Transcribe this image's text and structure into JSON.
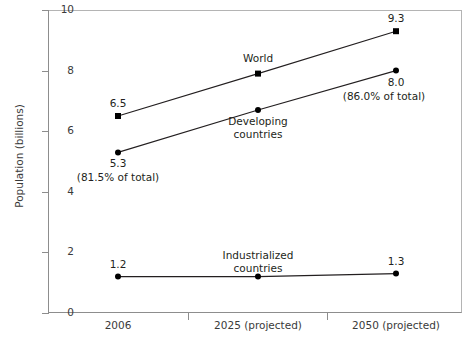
{
  "chart_data": {
    "type": "line",
    "title": "",
    "xlabel": "",
    "ylabel": "Population (billions)",
    "categories": [
      "2006",
      "2025 (projected)",
      "2050 (projected)"
    ],
    "ylim": [
      0,
      10
    ],
    "ytick_labels": [
      "0",
      "2",
      "4",
      "6",
      "8",
      "10"
    ],
    "ytick_values": [
      0,
      2,
      4,
      6,
      8,
      10
    ],
    "grid": false,
    "legend": "inline-annotations",
    "series": [
      {
        "name": "World",
        "marker": "square",
        "values": [
          6.5,
          7.9,
          9.3
        ],
        "point_labels": [
          "6.5",
          "",
          "9.3"
        ],
        "point_sublabels": [
          "",
          "",
          ""
        ]
      },
      {
        "name": "Developing countries",
        "marker": "circle",
        "values": [
          5.3,
          6.7,
          8.0
        ],
        "point_labels": [
          "5.3",
          "",
          "8.0"
        ],
        "point_sublabels": [
          "(81.5% of total)",
          "",
          "(86.0% of total)"
        ]
      },
      {
        "name": "Industrialized countries",
        "marker": "circle",
        "values": [
          1.2,
          1.2,
          1.3
        ],
        "point_labels": [
          "1.2",
          "",
          "1.3"
        ],
        "point_sublabels": [
          "",
          "",
          ""
        ]
      }
    ],
    "annotations": [
      {
        "text": "World",
        "series": "World"
      },
      {
        "text": "Developing",
        "series": "Developing countries"
      },
      {
        "text": "countries",
        "series": "Developing countries"
      },
      {
        "text": "Industrialized",
        "series": "Industrialized countries"
      },
      {
        "text": "countries",
        "series": "Industrialized countries"
      }
    ],
    "series_label_lines": {
      "world": [
        "World"
      ],
      "developing": [
        "Developing",
        "countries"
      ],
      "industrialized": [
        "Industrialized",
        "countries"
      ]
    },
    "colors": {
      "line": "#231f20",
      "marker": "#000000",
      "axis": "#8d8d8d",
      "text": "#231f20",
      "background": "#ffffff"
    }
  }
}
